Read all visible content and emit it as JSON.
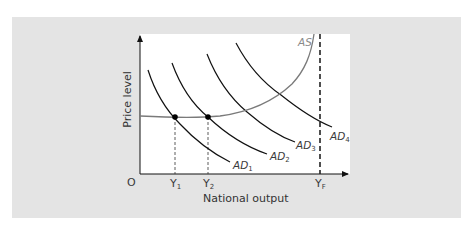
{
  "diagram": {
    "type": "AD-AS model",
    "x_axis": {
      "label": "National output",
      "origin_label": "O",
      "ticks": [
        {
          "id": "y1",
          "base": "Y",
          "sub": "1"
        },
        {
          "id": "y2",
          "base": "Y",
          "sub": "2"
        },
        {
          "id": "yf",
          "base": "Y",
          "sub": "F"
        }
      ]
    },
    "y_axis": {
      "label": "Price level"
    },
    "curves": [
      {
        "id": "as",
        "base": "AS",
        "sub": "",
        "color": "#7a7a7a"
      },
      {
        "id": "ad1",
        "base": "AD",
        "sub": "1",
        "color": "#111111"
      },
      {
        "id": "ad2",
        "base": "AD",
        "sub": "2",
        "color": "#111111"
      },
      {
        "id": "ad3",
        "base": "AD",
        "sub": "3",
        "color": "#111111"
      },
      {
        "id": "ad4",
        "base": "AD",
        "sub": "4",
        "color": "#111111"
      }
    ],
    "equilibrium_points": [
      {
        "id": "e1",
        "at": "Y1",
        "curves": [
          "AD1",
          "AS"
        ]
      },
      {
        "id": "e2",
        "at": "Y2",
        "curves": [
          "AD2",
          "AS"
        ]
      }
    ],
    "full_employment_line": {
      "at": "YF",
      "style": "dashed"
    },
    "colors": {
      "panel": "#e4e4e4",
      "plot": "#ffffff",
      "axis": "#111111"
    }
  }
}
